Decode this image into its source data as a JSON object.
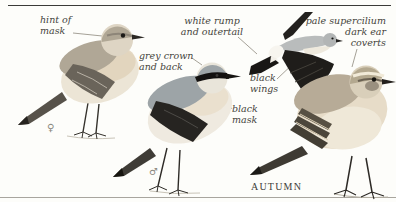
{
  "labels": {
    "hint_of_mask": "hint of\nmask",
    "white_rump": "white rump\nand outertail",
    "grey_crown": "grey crown\nand back",
    "black_wings": "black\nwings",
    "black_mask": "black\nmask",
    "pale_supercilium": "pale supercilium\ndark ear\ncoverts"
  },
  "caption": {
    "season": "AUTUMN"
  },
  "symbols": {
    "female": "♀",
    "male": "♂"
  },
  "illustrations": {
    "female_bird": "wheatear-female-perched",
    "male_bird": "wheatear-male-perched",
    "flying_bird": "wheatear-in-flight",
    "autumn_bird": "wheatear-autumn-perched"
  },
  "palette": {
    "background": "#fdfdfa",
    "label_text": "#45443c",
    "pointer_line": "#8e897e",
    "top_rule": "#3b3b38",
    "bottom_rule": "#a8a59e",
    "black_plumage": "#1e1c19",
    "grey_plumage": "#9da4a7",
    "buff_plumage": "#e7dcc8",
    "brown_plumage": "#b3a892"
  }
}
